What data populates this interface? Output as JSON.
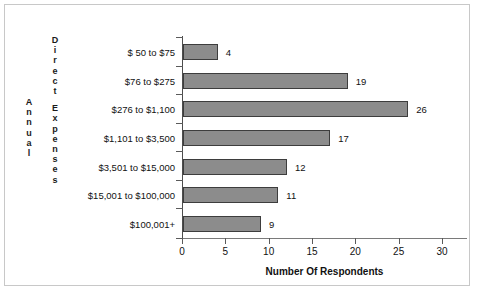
{
  "chart_data": {
    "type": "bar",
    "orientation": "horizontal",
    "title": "",
    "xlabel": "Number Of Respondents",
    "ylabel": "Annual Direct Expenses",
    "ylabel_parts": [
      "Annual",
      "Direct Expenses"
    ],
    "categories": [
      "$ 50 to $75",
      "$76 to $275",
      "$276 to $1,100",
      "$1,101 to $3,500",
      "$3,501 to $15,000",
      "$15,001 to $100,000",
      "$100,001+"
    ],
    "values": [
      4,
      19,
      26,
      17,
      12,
      11,
      9
    ],
    "value_labels": [
      "4",
      "19",
      "26",
      "17",
      "12",
      "11",
      "9"
    ],
    "xlim": [
      0,
      30
    ],
    "xticks": [
      0,
      5,
      10,
      15,
      20,
      25,
      30
    ],
    "xtick_labels": [
      "0",
      "5",
      "10",
      "15",
      "20",
      "25",
      "30"
    ],
    "grid": false,
    "legend": false,
    "bar_color": "#8c8c8c",
    "bar_border_color": "#3d3d3d",
    "axis_color": "#5a5a5a",
    "text_color": "#111111"
  }
}
